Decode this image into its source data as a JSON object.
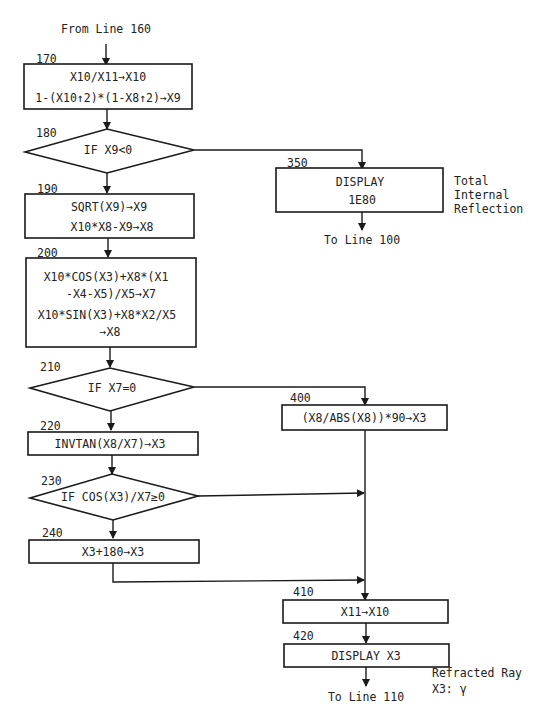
{
  "connectors": {
    "start": "From Line 160",
    "end_350": "To Line 100",
    "end_420": "To Line 110"
  },
  "nodes": [
    {
      "id": "170",
      "type": "process",
      "line_no": "170",
      "lines": [
        "X10/X11→X10",
        "1-(X10↑2)*(1-X8↑2)→X9"
      ]
    },
    {
      "id": "180",
      "type": "decision",
      "line_no": "180",
      "lines": [
        "IF X9<0"
      ]
    },
    {
      "id": "190",
      "type": "process",
      "line_no": "190",
      "lines": [
        "SQRT(X9)→X9",
        "X10*X8-X9→X8"
      ]
    },
    {
      "id": "200",
      "type": "process",
      "line_no": "200",
      "lines": [
        "X10*COS(X3)+X8*(X1",
        "-X4-X5)/X5→X7",
        "X10*SIN(X3)+X8*X2/X5",
        "→X8"
      ]
    },
    {
      "id": "210",
      "type": "decision",
      "line_no": "210",
      "lines": [
        "IF X7=0"
      ]
    },
    {
      "id": "220",
      "type": "process",
      "line_no": "220",
      "lines": [
        "INVTAN(X8/X7)→X3"
      ]
    },
    {
      "id": "230",
      "type": "decision",
      "line_no": "230",
      "lines": [
        "IF COS(X3)/X7≥0"
      ]
    },
    {
      "id": "240",
      "type": "process",
      "line_no": "240",
      "lines": [
        "X3+180→X3"
      ]
    },
    {
      "id": "350",
      "type": "process",
      "line_no": "350",
      "lines": [
        "DISPLAY",
        "1E80"
      ]
    },
    {
      "id": "400",
      "type": "process",
      "line_no": "400",
      "lines": [
        "(X8/ABS(X8))*90→X3"
      ]
    },
    {
      "id": "410",
      "type": "process",
      "line_no": "410",
      "lines": [
        "X11→X10"
      ]
    },
    {
      "id": "420",
      "type": "process",
      "line_no": "420",
      "lines": [
        "DISPLAY X3"
      ]
    }
  ],
  "annotations": {
    "350": [
      "Total",
      "Internal",
      "Reflection"
    ],
    "420": [
      "Refracted Ray",
      "X3: γ"
    ]
  },
  "edges": [
    {
      "from": "start",
      "to": "170"
    },
    {
      "from": "170",
      "to": "180"
    },
    {
      "from": "180",
      "to": "350",
      "branch": "true"
    },
    {
      "from": "180",
      "to": "190",
      "branch": "false"
    },
    {
      "from": "190",
      "to": "200"
    },
    {
      "from": "200",
      "to": "210"
    },
    {
      "from": "210",
      "to": "400",
      "branch": "true"
    },
    {
      "from": "210",
      "to": "220",
      "branch": "false"
    },
    {
      "from": "220",
      "to": "230"
    },
    {
      "from": "230",
      "to": "410",
      "branch": "true"
    },
    {
      "from": "230",
      "to": "240",
      "branch": "false"
    },
    {
      "from": "240",
      "to": "410"
    },
    {
      "from": "400",
      "to": "410"
    },
    {
      "from": "410",
      "to": "420"
    },
    {
      "from": "350",
      "to": "end_350"
    },
    {
      "from": "420",
      "to": "end_420"
    }
  ]
}
